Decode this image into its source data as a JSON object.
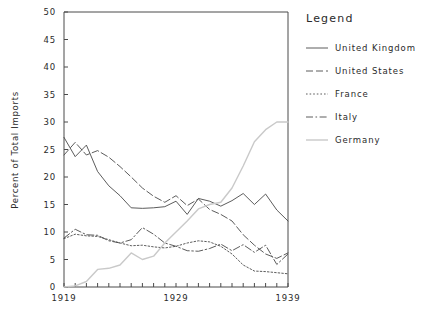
{
  "chart_data": {
    "type": "line",
    "title": "",
    "xlabel": "",
    "ylabel": "Percent of Total Imports",
    "legend_title": "Legend",
    "legend_position": "right",
    "grid": false,
    "xlim": [
      1919,
      1939
    ],
    "ylim": [
      0,
      50
    ],
    "x": [
      1919,
      1920,
      1921,
      1922,
      1923,
      1924,
      1925,
      1926,
      1927,
      1928,
      1929,
      1930,
      1931,
      1932,
      1933,
      1934,
      1935,
      1936,
      1937,
      1938,
      1939
    ],
    "x_ticks": [
      1919,
      1920,
      1921,
      1922,
      1923,
      1924,
      1925,
      1926,
      1927,
      1928,
      1929,
      1930,
      1931,
      1932,
      1933,
      1934,
      1935,
      1936,
      1937,
      1938,
      1939
    ],
    "x_tick_labels": [
      "1919",
      "",
      "",
      "",
      "",
      "",
      "",
      "",
      "",
      "",
      "1929",
      "",
      "",
      "",
      "",
      "",
      "",
      "",
      "",
      "",
      "1939"
    ],
    "y_ticks": [
      0,
      5,
      10,
      15,
      20,
      25,
      30,
      35,
      40,
      45,
      50
    ],
    "y_tick_labels": [
      "0",
      "5",
      "10",
      "15",
      "20",
      "25",
      "30",
      "35",
      "40",
      "45",
      "50"
    ],
    "series": [
      {
        "name": "United Kingdom",
        "style": "solid",
        "color": "#4a4a4a",
        "values": [
          27.2,
          23.7,
          25.8,
          21.0,
          18.4,
          16.6,
          14.4,
          14.3,
          14.4,
          14.6,
          15.6,
          13.2,
          16.1,
          15.6,
          14.7,
          15.7,
          17.0,
          15.0,
          16.9,
          14.0,
          12.0
        ]
      },
      {
        "name": "United States",
        "style": "dashed",
        "color": "#4a4a4a",
        "values": [
          24.0,
          26.3,
          24.0,
          24.8,
          23.6,
          21.9,
          20.0,
          18.0,
          16.5,
          15.4,
          16.6,
          14.8,
          16.0,
          14.1,
          13.2,
          12.0,
          9.5,
          7.6,
          6.0,
          5.2,
          6.2
        ]
      },
      {
        "name": "France",
        "style": "dotted",
        "color": "#4a4a4a",
        "values": [
          8.8,
          9.6,
          9.3,
          9.2,
          8.6,
          8.0,
          7.5,
          7.6,
          7.3,
          7.1,
          7.4,
          8.0,
          8.4,
          8.2,
          7.4,
          6.0,
          4.0,
          2.9,
          2.8,
          2.6,
          2.4
        ]
      },
      {
        "name": "Italy",
        "style": "dashdot",
        "color": "#4a4a4a",
        "values": [
          8.9,
          10.5,
          9.5,
          9.4,
          8.4,
          8.0,
          8.6,
          10.8,
          9.6,
          8.0,
          7.4,
          6.6,
          6.5,
          7.0,
          7.8,
          6.6,
          7.7,
          6.3,
          7.6,
          4.1,
          6.0
        ]
      },
      {
        "name": "Germany",
        "style": "light",
        "color": "#c9c9c9",
        "values": [
          0.0,
          0.2,
          1.0,
          3.2,
          3.4,
          4.0,
          6.2,
          5.0,
          5.6,
          8.0,
          10.0,
          12.0,
          14.2,
          15.0,
          15.4,
          18.0,
          22.0,
          26.4,
          28.6,
          30.0,
          30.0
        ]
      }
    ]
  },
  "legend": {
    "title": "Legend",
    "entries": [
      {
        "label": "United Kingdom",
        "style": "solid"
      },
      {
        "label": "United States",
        "style": "dashed"
      },
      {
        "label": "France",
        "style": "dotted"
      },
      {
        "label": "Italy",
        "style": "dashdot"
      },
      {
        "label": "Germany",
        "style": "light"
      }
    ]
  },
  "axes": {
    "y_title": "Percent of Total Imports"
  }
}
